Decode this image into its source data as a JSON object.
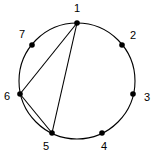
{
  "figure": {
    "title": "",
    "width": 159,
    "height": 155,
    "background_color": "#ffffff",
    "stroke_color": "#000000"
  },
  "chart_data": {
    "type": "diagram",
    "diagram_kind": "circular-graph",
    "title": "",
    "layout": {
      "center_x": 77,
      "center_y": 81,
      "radius": 58,
      "start_angle_deg": -90,
      "direction": "clockwise",
      "node_count": 7,
      "node_radius_px": 2.8,
      "label_offset_px": 15
    },
    "nodes": [
      {
        "id": 1,
        "label": "1",
        "angle_deg": -90,
        "x": 77,
        "y": 23,
        "label_x": 77,
        "label_y": 9
      },
      {
        "id": 2,
        "label": "2",
        "angle_deg": -38.571,
        "x": 122,
        "y": 45,
        "label_x": 133,
        "label_y": 36
      },
      {
        "id": 3,
        "label": "3",
        "angle_deg": 12.857,
        "x": 133,
        "y": 94,
        "label_x": 147,
        "label_y": 98
      },
      {
        "id": 4,
        "label": "4",
        "angle_deg": 64.286,
        "x": 102,
        "y": 133,
        "label_x": 104,
        "label_y": 147
      },
      {
        "id": 5,
        "label": "5",
        "angle_deg": 115.714,
        "x": 52,
        "y": 133,
        "label_x": 46,
        "label_y": 147
      },
      {
        "id": 6,
        "label": "6",
        "angle_deg": 167.143,
        "x": 20,
        "y": 94,
        "label_x": 7,
        "label_y": 97
      },
      {
        "id": 7,
        "label": "7",
        "angle_deg": 218.571,
        "x": 32,
        "y": 45,
        "label_x": 22,
        "label_y": 35
      }
    ],
    "edges": [
      {
        "from": 1,
        "to": 6,
        "kind": "chord"
      },
      {
        "from": 1,
        "to": 5,
        "kind": "chord"
      },
      {
        "from": 6,
        "to": 5,
        "kind": "chord"
      }
    ],
    "edge_count": 3,
    "legend": [],
    "xlabel": "",
    "ylabel": ""
  }
}
